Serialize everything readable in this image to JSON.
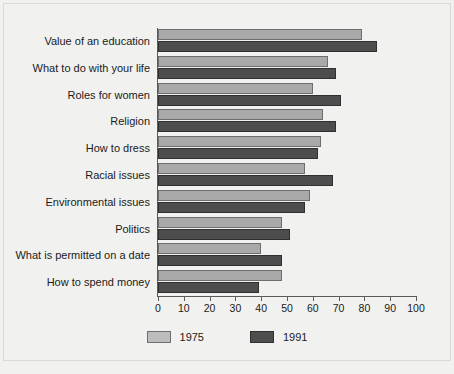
{
  "chart_data": {
    "type": "bar",
    "orientation": "horizontal",
    "title": "",
    "subtitle": "",
    "xlabel": "",
    "ylabel": "",
    "xlim": [
      0,
      100
    ],
    "xticks": [
      0,
      10,
      20,
      30,
      40,
      50,
      60,
      70,
      80,
      90,
      100
    ],
    "xtick_labels": [
      "0",
      "10",
      "20",
      "30",
      "40",
      "50",
      "60",
      "70",
      "80",
      "90",
      "100"
    ],
    "grid": false,
    "legend_position": "bottom",
    "categories": [
      "Value of an education",
      "What to do with your life",
      "Roles for women",
      "Religion",
      "How to dress",
      "Racial issues",
      "Environmental issues",
      "Politics",
      "What is permitted on a date",
      "How to spend money"
    ],
    "series": [
      {
        "name": "1975",
        "color": "#a9a9a9",
        "values": [
          79,
          66,
          60,
          64,
          63,
          57,
          59,
          48,
          40,
          48
        ]
      },
      {
        "name": "1991",
        "color": "#4d4d4d",
        "values": [
          85,
          69,
          71,
          69,
          62,
          68,
          57,
          51,
          48,
          39
        ]
      }
    ]
  },
  "colors": {
    "background": "#f1f1ef",
    "frame_border": "#d9d9d7",
    "axis": "#5a5a5a",
    "text": "#1b1b1b",
    "series_1975": "#a9a9a9",
    "series_1991": "#4d4d4d"
  }
}
